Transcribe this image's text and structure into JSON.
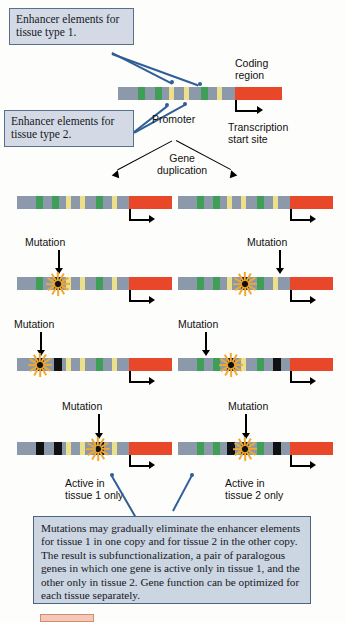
{
  "figure": {
    "callouts": [
      {
        "id": "enhancer-tissue-1",
        "text": "Enhancer elements for tissue type 1."
      },
      {
        "id": "enhancer-tissue-2",
        "text": "Enhancer elements for tissue type 2."
      }
    ],
    "labels": {
      "coding_region": "Coding\nregion",
      "promoter": "Promoter",
      "transcription_start_site": "Transcription\nstart site",
      "gene_duplication": "Gene\nduplication",
      "mutation": "Mutation",
      "active_tissue_1": "Active in\ntissue 1 only",
      "active_tissue_2": "Active in\ntissue 2 only"
    },
    "caption": "Mutations may gradually eliminate the enhancer elements for tissue 1 in one copy and for tissue 2 in the other copy. The result is subfunctionalization, a pair of paralogous genes in which one gene is active only in tissue 1, and the other only in tissue 2. Gene function can be optimized for each tissue separately.",
    "colors": {
      "backbone_gray": "#8b99ab",
      "coding_red": "#e8472a",
      "enhancer_tissue1_green": "#3f9f56",
      "enhancer_tissue2_yellow": "#ece08a",
      "mutated_black": "#111111",
      "callout_fill": "#d3dae6",
      "callout_border": "#4d6480",
      "leader_blue": "#2f5f96",
      "burst_orange": "#f0a830"
    },
    "legend": {
      "green": "Enhancer element for tissue type 1",
      "yellow": "Enhancer element for tissue type 2",
      "black": "Mutated (inactivated) enhancer element",
      "red": "Coding region",
      "gray": "Non-coding backbone DNA"
    }
  },
  "rows": [
    {
      "id": "ancestral-gene",
      "name": "Ancestral single-copy gene",
      "x": 118,
      "y": 87,
      "width": 164,
      "coding_start": 117,
      "coding_width": 47,
      "segments": [
        {
          "type": "green",
          "x": 20,
          "w": 7
        },
        {
          "type": "green",
          "x": 37,
          "w": 7
        },
        {
          "type": "yellow",
          "x": 51,
          "w": 5
        },
        {
          "type": "yellow",
          "x": 66,
          "w": 5
        },
        {
          "type": "green",
          "x": 83,
          "w": 7
        },
        {
          "type": "yellow",
          "x": 99,
          "w": 5
        }
      ]
    },
    {
      "id": "copy-1-stage-1",
      "name": "Copy 1 after duplication",
      "x": 17,
      "y": 196,
      "width": 155,
      "coding_start": 112,
      "coding_width": 43,
      "segments": [
        {
          "type": "green",
          "x": 19,
          "w": 7
        },
        {
          "type": "green",
          "x": 35,
          "w": 7
        },
        {
          "type": "yellow",
          "x": 49,
          "w": 5
        },
        {
          "type": "yellow",
          "x": 63,
          "w": 5
        },
        {
          "type": "green",
          "x": 79,
          "w": 7
        },
        {
          "type": "yellow",
          "x": 95,
          "w": 5
        }
      ]
    },
    {
      "id": "copy-2-stage-1",
      "name": "Copy 2 after duplication",
      "x": 178,
      "y": 196,
      "width": 155,
      "coding_start": 112,
      "coding_width": 43,
      "segments": [
        {
          "type": "green",
          "x": 19,
          "w": 7
        },
        {
          "type": "green",
          "x": 35,
          "w": 7
        },
        {
          "type": "yellow",
          "x": 49,
          "w": 5
        },
        {
          "type": "yellow",
          "x": 63,
          "w": 5
        },
        {
          "type": "green",
          "x": 79,
          "w": 7
        },
        {
          "type": "yellow",
          "x": 95,
          "w": 5
        }
      ]
    },
    {
      "id": "copy-1-stage-2",
      "name": "Copy 1 after first mutation",
      "x": 17,
      "y": 277,
      "width": 155,
      "coding_start": 112,
      "coding_width": 43,
      "burst_x": 41,
      "segments": [
        {
          "type": "green",
          "x": 19,
          "w": 7
        },
        {
          "type": "black",
          "x": 37,
          "w": 8
        },
        {
          "type": "yellow",
          "x": 49,
          "w": 5
        },
        {
          "type": "yellow",
          "x": 63,
          "w": 5
        },
        {
          "type": "green",
          "x": 79,
          "w": 7
        },
        {
          "type": "yellow",
          "x": 95,
          "w": 5
        }
      ]
    },
    {
      "id": "copy-2-stage-2",
      "name": "Copy 2 after first mutation",
      "x": 178,
      "y": 277,
      "width": 155,
      "coding_start": 112,
      "coding_width": 43,
      "burst_x": 67,
      "segments": [
        {
          "type": "green",
          "x": 19,
          "w": 7
        },
        {
          "type": "green",
          "x": 35,
          "w": 7
        },
        {
          "type": "yellow",
          "x": 49,
          "w": 5
        },
        {
          "type": "black",
          "x": 63,
          "w": 8
        },
        {
          "type": "green",
          "x": 79,
          "w": 7
        },
        {
          "type": "yellow",
          "x": 95,
          "w": 5
        }
      ]
    },
    {
      "id": "copy-1-stage-3",
      "name": "Copy 1 after second mutation",
      "x": 17,
      "y": 358,
      "width": 155,
      "coding_start": 112,
      "coding_width": 43,
      "burst_x": 23,
      "segments": [
        {
          "type": "black",
          "x": 19,
          "w": 8
        },
        {
          "type": "black",
          "x": 37,
          "w": 8
        },
        {
          "type": "yellow",
          "x": 49,
          "w": 5
        },
        {
          "type": "yellow",
          "x": 63,
          "w": 5
        },
        {
          "type": "green",
          "x": 79,
          "w": 7
        },
        {
          "type": "yellow",
          "x": 95,
          "w": 5
        }
      ]
    },
    {
      "id": "copy-2-stage-3",
      "name": "Copy 2 after second mutation",
      "x": 178,
      "y": 358,
      "width": 155,
      "coding_start": 112,
      "coding_width": 43,
      "burst_x": 53,
      "segments": [
        {
          "type": "green",
          "x": 19,
          "w": 7
        },
        {
          "type": "green",
          "x": 35,
          "w": 7
        },
        {
          "type": "black",
          "x": 49,
          "w": 8
        },
        {
          "type": "yellow",
          "x": 63,
          "w": 5
        },
        {
          "type": "green",
          "x": 79,
          "w": 7
        },
        {
          "type": "black",
          "x": 95,
          "w": 8
        }
      ]
    },
    {
      "id": "copy-1-final",
      "name": "Copy 1 final - active in tissue 1 only",
      "x": 17,
      "y": 442,
      "width": 155,
      "coding_start": 112,
      "coding_width": 43,
      "burst_x": 81,
      "segments": [
        {
          "type": "black",
          "x": 19,
          "w": 8
        },
        {
          "type": "black",
          "x": 37,
          "w": 8
        },
        {
          "type": "yellow",
          "x": 49,
          "w": 5
        },
        {
          "type": "yellow",
          "x": 63,
          "w": 5
        },
        {
          "type": "black",
          "x": 79,
          "w": 8
        },
        {
          "type": "yellow",
          "x": 95,
          "w": 5
        }
      ]
    },
    {
      "id": "copy-2-final",
      "name": "Copy 2 final - active in tissue 2 only",
      "x": 178,
      "y": 442,
      "width": 155,
      "coding_start": 112,
      "coding_width": 43,
      "burst_x": 67,
      "segments": [
        {
          "type": "green",
          "x": 19,
          "w": 7
        },
        {
          "type": "green",
          "x": 35,
          "w": 7
        },
        {
          "type": "black",
          "x": 49,
          "w": 8
        },
        {
          "type": "black",
          "x": 63,
          "w": 8
        },
        {
          "type": "green",
          "x": 79,
          "w": 7
        },
        {
          "type": "black",
          "x": 95,
          "w": 8
        }
      ]
    }
  ]
}
